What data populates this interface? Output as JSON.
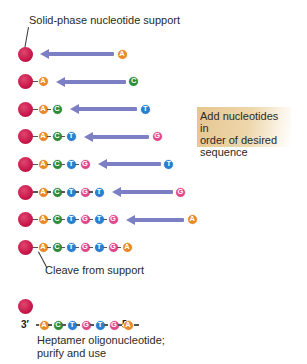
{
  "title_label": "Solid-phase nucleotide support",
  "instruction_box": {
    "lines": [
      "Add nucleotides in",
      "order of desired",
      "sequence"
    ],
    "color": "#e6c690"
  },
  "cleave_label": "Cleave from support",
  "product": {
    "prime3": "3′",
    "prime5": "5′",
    "sequence": [
      "A",
      "C",
      "T",
      "G",
      "T",
      "G",
      "A"
    ],
    "caption_lines": [
      "Heptamer oligonucleotide;",
      "purify and use"
    ]
  },
  "colors": {
    "support": "#c8174a",
    "arrow": "#7c7fc4",
    "A": "#e88a2a",
    "C": "#2e8b3a",
    "T": "#2a7fd0",
    "G": "#e0488a"
  },
  "steps": [
    {
      "chain": [],
      "incoming": "A"
    },
    {
      "chain": [
        "A"
      ],
      "incoming": "C"
    },
    {
      "chain": [
        "A",
        "C"
      ],
      "incoming": "T"
    },
    {
      "chain": [
        "A",
        "C",
        "T"
      ],
      "incoming": "G"
    },
    {
      "chain": [
        "A",
        "C",
        "T",
        "G"
      ],
      "incoming": "T"
    },
    {
      "chain": [
        "A",
        "C",
        "T",
        "G",
        "T"
      ],
      "incoming": "G"
    },
    {
      "chain": [
        "A",
        "C",
        "T",
        "G",
        "T",
        "G"
      ],
      "incoming": "A"
    },
    {
      "chain": [
        "A",
        "C",
        "T",
        "G",
        "T",
        "G",
        "A"
      ],
      "incoming": null
    }
  ]
}
